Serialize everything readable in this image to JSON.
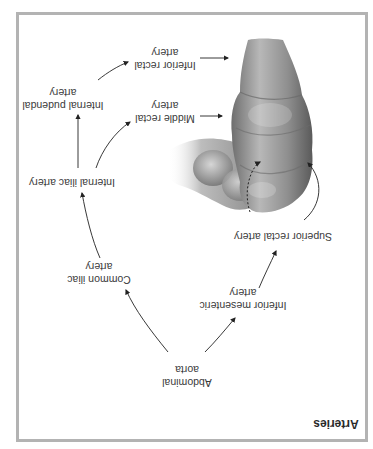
{
  "figure": {
    "title": "Arteries",
    "orientation": "rotated-180",
    "colors": {
      "frame": "#b3b3b3",
      "text": "#3a3a3a",
      "arrow": "#222222",
      "tissue": "#9a9a9a"
    },
    "nodes": [
      {
        "id": "abdominal_aorta",
        "lines": [
          "Abdominal",
          "aorta"
        ]
      },
      {
        "id": "common_iliac",
        "lines": [
          "Common iliac",
          "artery"
        ]
      },
      {
        "id": "internal_iliac",
        "lines": [
          "Internal iliac artery"
        ]
      },
      {
        "id": "internal_pudendal",
        "lines": [
          "Internal pudendal",
          "artery"
        ]
      },
      {
        "id": "inferior_rectal",
        "lines": [
          "Inferior rectal",
          "artery"
        ]
      },
      {
        "id": "middle_rectal",
        "lines": [
          "Middle rectal",
          "artery"
        ]
      },
      {
        "id": "inferior_mesenteric",
        "lines": [
          "Inferior mesenteric",
          "artery"
        ]
      },
      {
        "id": "superior_rectal",
        "lines": [
          "Superior rectal artery"
        ]
      }
    ],
    "edges": [
      [
        "Abdominal aorta",
        "Common iliac artery"
      ],
      [
        "Abdominal aorta",
        "Inferior mesenteric artery"
      ],
      [
        "Common iliac artery",
        "Internal iliac artery"
      ],
      [
        "Internal iliac artery",
        "Internal pudendal artery"
      ],
      [
        "Internal iliac artery",
        "Middle rectal artery"
      ],
      [
        "Internal pudendal artery",
        "Inferior rectal artery"
      ],
      [
        "Inferior rectal artery",
        "rectum/anal canal"
      ],
      [
        "Middle rectal artery",
        "rectum"
      ],
      [
        "Inferior mesenteric artery",
        "Superior rectal artery"
      ],
      [
        "Superior rectal artery",
        "rectum"
      ]
    ],
    "illustration": "rectum-and-sigmoid-colon"
  }
}
